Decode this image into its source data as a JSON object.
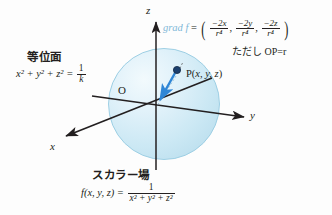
{
  "figure": {
    "title_level_surface": "等位面",
    "title_scalar_field": "スカラー場",
    "origin_label": "O",
    "point_label_prefix": "P(",
    "point_label_vars": "x, y, z",
    "point_label_suffix": ")",
    "axes": {
      "x": "x",
      "y": "y",
      "z": "z"
    },
    "level_surface_equation": {
      "lhs": "x² + y² + z² =",
      "rhs_numerator": "1",
      "rhs_denominator": "k",
      "plain": "x^2 + y^2 + z^2 = 1/k"
    },
    "scalar_field_equation": {
      "lhs": "f(x, y, z) =",
      "rhs_numerator": "1",
      "rhs_denominator": "x² + y² + z²",
      "plain": "f(x, y, z) = 1/(x^2 + y^2 + z^2)"
    },
    "gradient": {
      "label": "grad f",
      "equals": "=",
      "open_paren": "(",
      "close_paren": ")",
      "components": [
        {
          "numerator": "−2x",
          "denominator": "r⁴"
        },
        {
          "numerator": "−2y",
          "denominator": "r⁴"
        },
        {
          "numerator": "−2z",
          "denominator": "r⁴"
        }
      ],
      "separator": ",",
      "plain": "grad f = ( -2x/r^4 , -2y/r^4 , -2z/r^4 )",
      "note": "ただし OP=r",
      "label_color": "#7fb8d8"
    },
    "colors": {
      "sphere_fill": "#cbe8f4",
      "sphere_edge": "#9dcfe4",
      "gradient_arrow": "#2f86d6",
      "point_marker": "#1b3f6e",
      "axis": "#231f20",
      "background": "#fdfdfd"
    }
  }
}
